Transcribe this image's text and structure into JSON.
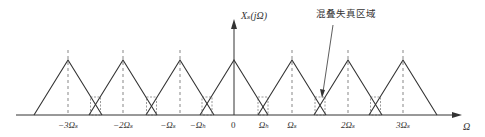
{
  "diagram": {
    "title_label": "Xₛ(jΩ)",
    "annotation": "混叠失真区域",
    "axis_label": "Ω",
    "origin_label": "0",
    "tick_labels": [
      {
        "text": "−3Ωₛ",
        "x": 68
      },
      {
        "text": "−2Ωₛ",
        "x": 123
      },
      {
        "text": "−Ωₛ",
        "x": 168
      },
      {
        "text": "−Ωₕ",
        "x": 198
      },
      {
        "text": "Ωₕ",
        "x": 264
      },
      {
        "text": "Ωₛ",
        "x": 292
      },
      {
        "text": "2Ωₛ",
        "x": 348
      },
      {
        "text": "3Ωₛ",
        "x": 403
      }
    ],
    "peaks_x": [
      68,
      123,
      180,
      234,
      292,
      348,
      403
    ],
    "triangle_half_width": 34,
    "baseline_y": 115,
    "peak_y": 60,
    "line_color": "#333333"
  }
}
